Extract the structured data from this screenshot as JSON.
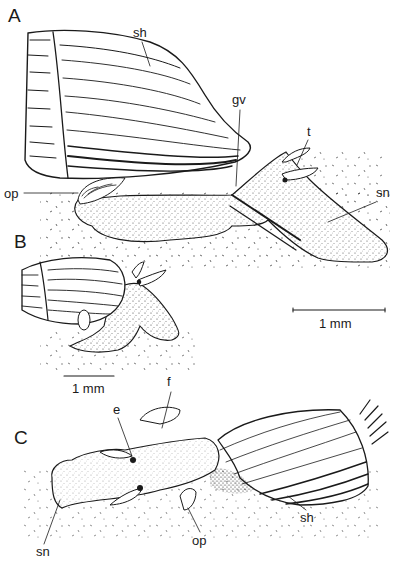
{
  "figure": {
    "panels": [
      {
        "id": "A",
        "label": "A",
        "labels": {
          "shell": "sh",
          "groove": "gv",
          "tentacle": "t",
          "operculum": "op",
          "snout": "sn"
        }
      },
      {
        "id": "B",
        "label": "B",
        "scale_bar": "1 mm"
      },
      {
        "id": "C",
        "label": "C",
        "labels": {
          "eye": "e",
          "foot": "f",
          "snout": "sn",
          "operculum": "op",
          "shell": "sh"
        }
      }
    ],
    "scale_bar_A": "1 mm"
  },
  "colors": {
    "ink": "#1a1a1a",
    "background": "#ffffff"
  }
}
